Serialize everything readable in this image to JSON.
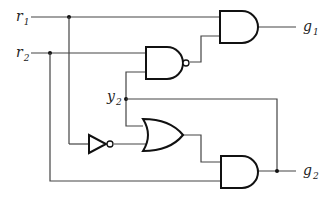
{
  "diagram": {
    "type": "logic-circuit",
    "inputs": [
      {
        "name": "r",
        "sub": "1"
      },
      {
        "name": "r",
        "sub": "2"
      }
    ],
    "internal": [
      {
        "name": "y",
        "sub": "2"
      }
    ],
    "outputs": [
      {
        "name": "g",
        "sub": "1"
      },
      {
        "name": "g",
        "sub": "2"
      }
    ],
    "gates": [
      {
        "id": "and-g1",
        "type": "AND",
        "inputs": [
          "r1",
          "nand-out"
        ],
        "output": "g1"
      },
      {
        "id": "nand",
        "type": "NAND",
        "inputs": [
          "r2",
          "y2"
        ],
        "output": "nand-out"
      },
      {
        "id": "not",
        "type": "NOT",
        "inputs": [
          "r1"
        ],
        "output": "not-r1"
      },
      {
        "id": "or",
        "type": "OR",
        "inputs": [
          "y2",
          "not-r1"
        ],
        "output": "or-out"
      },
      {
        "id": "and-g2",
        "type": "AND",
        "inputs": [
          "or-out",
          "r2"
        ],
        "output": "g2"
      }
    ],
    "feedback": "g2 fed back as y2"
  }
}
